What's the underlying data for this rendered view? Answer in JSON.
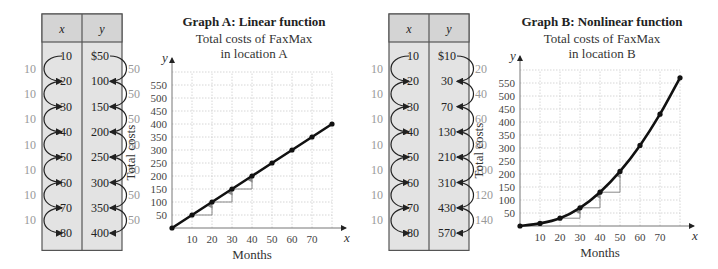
{
  "tables": [
    {
      "id": "table-a",
      "headers": [
        "x",
        "y"
      ],
      "x_values": [
        "10",
        "20",
        "30",
        "40",
        "50",
        "60",
        "70",
        "80"
      ],
      "y_values": [
        "$50",
        "100",
        "150",
        "200",
        "250",
        "300",
        "350",
        "400"
      ],
      "x_diffs": [
        "10",
        "10",
        "10",
        "10",
        "10",
        "10",
        "10"
      ],
      "y_diffs": [
        "50",
        "50",
        "50",
        "50",
        "50",
        "50",
        "50"
      ]
    },
    {
      "id": "table-b",
      "headers": [
        "x",
        "y"
      ],
      "x_values": [
        "10",
        "20",
        "30",
        "40",
        "50",
        "60",
        "70",
        "80"
      ],
      "y_values": [
        "$10",
        "30",
        "70",
        "130",
        "210",
        "310",
        "430",
        "570"
      ],
      "x_diffs": [
        "10",
        "10",
        "10",
        "10",
        "10",
        "10",
        "10"
      ],
      "y_diffs": [
        "20",
        "40",
        "60",
        "80",
        "100",
        "120",
        "140"
      ]
    }
  ],
  "chart_data": [
    {
      "type": "line",
      "title": "Graph A:  Linear function",
      "subtitle": [
        "Total costs of FaxMax",
        "in location A"
      ],
      "xlabel": "Months",
      "ylabel": "Total costs",
      "x_axis_var": "x",
      "y_axis_var": "y",
      "x": [
        0,
        10,
        20,
        30,
        40,
        50,
        60,
        70,
        80
      ],
      "y": [
        0,
        50,
        100,
        150,
        200,
        250,
        300,
        350,
        400
      ],
      "x_ticks": [
        "10",
        "20",
        "30",
        "40",
        "50",
        "60",
        "70"
      ],
      "y_ticks": [
        "50",
        "100",
        "150",
        "200",
        "250",
        "300",
        "350",
        "400",
        "450",
        "500",
        "550"
      ],
      "xlim": [
        0,
        80
      ],
      "ylim": [
        0,
        600
      ],
      "grid": true,
      "step_markers_at_x": [
        10,
        20,
        30
      ]
    },
    {
      "type": "line",
      "title": "Graph B:  Nonlinear function",
      "subtitle": [
        "Total costs of FaxMax",
        "in location B"
      ],
      "xlabel": "Months",
      "ylabel": "Total costs",
      "x_axis_var": "x",
      "y_axis_var": "y",
      "x": [
        0,
        10,
        20,
        30,
        40,
        50,
        60,
        70,
        80
      ],
      "y": [
        0,
        10,
        30,
        70,
        130,
        210,
        310,
        430,
        570
      ],
      "x_ticks": [
        "10",
        "20",
        "30",
        "40",
        "50",
        "60",
        "70"
      ],
      "y_ticks": [
        "50",
        "100",
        "150",
        "200",
        "250",
        "300",
        "350",
        "400",
        "450",
        "500",
        "550"
      ],
      "xlim": [
        0,
        80
      ],
      "ylim": [
        0,
        600
      ],
      "grid": true,
      "step_markers_at_x": [
        20,
        30,
        40
      ]
    }
  ]
}
